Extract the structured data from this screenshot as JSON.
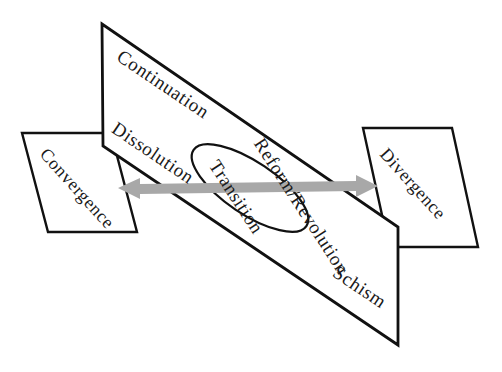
{
  "diagram": {
    "colors": {
      "outline": "#111111",
      "arrow": "#a8a8a8",
      "background": "#ffffff",
      "text": "#1a1a1a"
    },
    "main_panel": {
      "name": "main-parallelogram",
      "labels": {
        "top_left": "Continuation",
        "middle_left": "Dissolution",
        "middle_right": "Reform/Revolution",
        "bottom_right": "Schism"
      }
    },
    "center_ellipse": {
      "name": "transition-ellipse",
      "label": "Transition"
    },
    "left_panel": {
      "name": "convergence-panel",
      "label": "Convergence"
    },
    "right_panel": {
      "name": "divergence-panel",
      "label": "Divergence"
    },
    "arrow": {
      "name": "bidirectional-arrow",
      "direction": "double-headed-horizontal",
      "color": "#a8a8a8"
    }
  }
}
